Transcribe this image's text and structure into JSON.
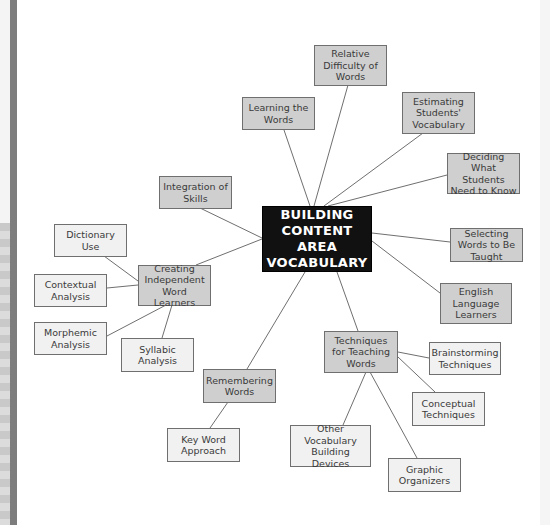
{
  "diagram": {
    "type": "concept-map",
    "colors": {
      "center_fill": "#111111",
      "center_text": "#ffffff",
      "primary_fill": "#cfcfcf",
      "secondary_fill": "#f1f1f1",
      "line": "#6f6f6f"
    },
    "center": {
      "label": "BUILDING CONTENT AREA VOCABULARY"
    },
    "nodes": {
      "relative_difficulty": {
        "label": "Relative Difficulty of Words",
        "level": "primary"
      },
      "learning_words": {
        "label": "Learning the Words",
        "level": "primary"
      },
      "estimating": {
        "label": "Estimating Students' Vocabulary",
        "level": "primary"
      },
      "deciding": {
        "label": "Deciding What Students Need to Know",
        "level": "primary"
      },
      "selecting": {
        "label": "Selecting Words to Be Taught",
        "level": "primary"
      },
      "ell": {
        "label": "English Language Learners",
        "level": "primary"
      },
      "integration": {
        "label": "Integration of Skills",
        "level": "primary"
      },
      "creating": {
        "label": "Creating Independent Word Learners",
        "level": "primary"
      },
      "dictionary": {
        "label": "Dictionary Use",
        "level": "secondary",
        "parent": "creating"
      },
      "contextual": {
        "label": "Contextual Analysis",
        "level": "secondary",
        "parent": "creating"
      },
      "morphemic": {
        "label": "Morphemic Analysis",
        "level": "secondary",
        "parent": "creating"
      },
      "syllabic": {
        "label": "Syllabic Analysis",
        "level": "secondary",
        "parent": "creating"
      },
      "remembering": {
        "label": "Remembering Words",
        "level": "primary"
      },
      "keyword": {
        "label": "Key Word Approach",
        "level": "secondary",
        "parent": "remembering"
      },
      "techniques": {
        "label": "Techniques for Teaching Words",
        "level": "primary"
      },
      "brainstorming": {
        "label": "Brainstorming Techniques",
        "level": "secondary",
        "parent": "techniques"
      },
      "conceptual": {
        "label": "Conceptual Techniques",
        "level": "secondary",
        "parent": "techniques"
      },
      "other_devices": {
        "label": "Other Vocabulary Building Devices",
        "level": "secondary",
        "parent": "techniques"
      },
      "graphic": {
        "label": "Graphic Organizers",
        "level": "secondary",
        "parent": "techniques"
      }
    }
  }
}
